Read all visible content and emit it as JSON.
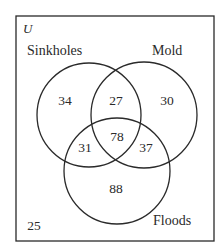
{
  "diagram": {
    "type": "venn",
    "universe": {
      "label": "U",
      "outside_count": "25"
    },
    "sets": [
      {
        "name": "Sinkholes",
        "label": "Sinkholes"
      },
      {
        "name": "Mold",
        "label": "Mold"
      },
      {
        "name": "Floods",
        "label": "Floods"
      }
    ],
    "regions": {
      "sinkholes_only": "34",
      "mold_only": "30",
      "floods_only": "88",
      "sinkholes_mold_only": "27",
      "sinkholes_floods_only": "31",
      "mold_floods_only": "37",
      "all_three": "78",
      "none": "25"
    },
    "colors": {
      "stroke": "#2a2a2a",
      "background": "#ffffff"
    }
  }
}
